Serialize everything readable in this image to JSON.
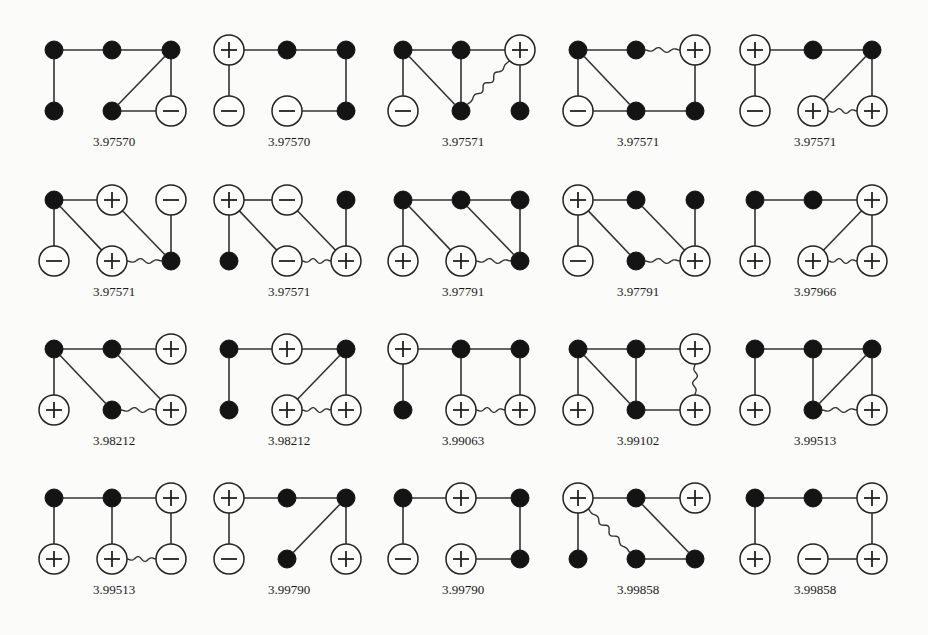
{
  "figure": {
    "node_legend": {
      "filled": "neutral site",
      "plus": "+",
      "minus": "−"
    },
    "graphs": [
      {
        "value": "3.97570",
        "nodes": {
          "t0": "filled",
          "t1": "filled",
          "t2": "filled",
          "b0": "filled",
          "b1": "filled",
          "b2": "minus"
        },
        "edges": [
          [
            "t0",
            "t1"
          ],
          [
            "t1",
            "t2"
          ],
          [
            "t0",
            "b0"
          ],
          [
            "t2",
            "b1"
          ],
          [
            "t2",
            "b2"
          ],
          [
            "b1",
            "b2"
          ]
        ],
        "wavy": []
      },
      {
        "value": "3.97570",
        "nodes": {
          "t0": "plus",
          "t1": "filled",
          "t2": "filled",
          "b0": "minus",
          "b1": "minus",
          "b2": "filled"
        },
        "edges": [
          [
            "t0",
            "t1"
          ],
          [
            "t1",
            "t2"
          ],
          [
            "t0",
            "b0"
          ],
          [
            "t2",
            "b2"
          ],
          [
            "b1",
            "b2"
          ]
        ],
        "wavy": []
      },
      {
        "value": "3.97571",
        "nodes": {
          "t0": "filled",
          "t1": "filled",
          "t2": "plus",
          "b0": "minus",
          "b1": "filled",
          "b2": "filled"
        },
        "edges": [
          [
            "t0",
            "t1"
          ],
          [
            "t1",
            "t2"
          ],
          [
            "t0",
            "b0"
          ],
          [
            "t0",
            "b1"
          ],
          [
            "t1",
            "b1"
          ],
          [
            "t2",
            "b2"
          ]
        ],
        "wavy": [
          [
            "t2",
            "b1"
          ]
        ]
      },
      {
        "value": "3.97571",
        "nodes": {
          "t0": "filled",
          "t1": "filled",
          "t2": "plus",
          "b0": "minus",
          "b1": "filled",
          "b2": "filled"
        },
        "edges": [
          [
            "t0",
            "t1"
          ],
          [
            "t0",
            "b0"
          ],
          [
            "t0",
            "b1"
          ],
          [
            "b0",
            "b1"
          ],
          [
            "b1",
            "b2"
          ],
          [
            "t2",
            "b2"
          ]
        ],
        "wavy": [
          [
            "t1",
            "t2"
          ]
        ]
      },
      {
        "value": "3.97571",
        "nodes": {
          "t0": "plus",
          "t1": "filled",
          "t2": "filled",
          "b0": "minus",
          "b1": "plus",
          "b2": "plus"
        },
        "edges": [
          [
            "t0",
            "t1"
          ],
          [
            "t1",
            "t2"
          ],
          [
            "t0",
            "b0"
          ],
          [
            "t2",
            "b1"
          ],
          [
            "t2",
            "b2"
          ]
        ],
        "wavy": [
          [
            "b1",
            "b2"
          ]
        ]
      },
      {
        "value": "3.97571",
        "nodes": {
          "t0": "filled",
          "t1": "plus",
          "t2": "minus",
          "b0": "minus",
          "b1": "plus",
          "b2": "filled"
        },
        "edges": [
          [
            "t0",
            "t1"
          ],
          [
            "t0",
            "b0"
          ],
          [
            "t0",
            "b1"
          ],
          [
            "t1",
            "b2"
          ],
          [
            "t2",
            "b2"
          ]
        ],
        "wavy": [
          [
            "b1",
            "b2"
          ]
        ]
      },
      {
        "value": "3.97571",
        "nodes": {
          "t0": "plus",
          "t1": "minus",
          "t2": "filled",
          "b0": "filled",
          "b1": "minus",
          "b2": "plus"
        },
        "edges": [
          [
            "t0",
            "t1"
          ],
          [
            "t0",
            "b0"
          ],
          [
            "t0",
            "b1"
          ],
          [
            "t1",
            "b2"
          ],
          [
            "t2",
            "b2"
          ]
        ],
        "wavy": [
          [
            "b1",
            "b2"
          ]
        ]
      },
      {
        "value": "3.97791",
        "nodes": {
          "t0": "filled",
          "t1": "filled",
          "t2": "filled",
          "b0": "plus",
          "b1": "plus",
          "b2": "filled"
        },
        "edges": [
          [
            "t0",
            "t1"
          ],
          [
            "t1",
            "t2"
          ],
          [
            "t0",
            "b0"
          ],
          [
            "t0",
            "b1"
          ],
          [
            "t1",
            "b2"
          ],
          [
            "t2",
            "b2"
          ]
        ],
        "wavy": [
          [
            "b1",
            "b2"
          ]
        ]
      },
      {
        "value": "3.97791",
        "nodes": {
          "t0": "plus",
          "t1": "filled",
          "t2": "filled",
          "b0": "minus",
          "b1": "filled",
          "b2": "plus"
        },
        "edges": [
          [
            "t0",
            "t1"
          ],
          [
            "t0",
            "b0"
          ],
          [
            "t0",
            "b1"
          ],
          [
            "t1",
            "b2"
          ],
          [
            "t2",
            "b2"
          ]
        ],
        "wavy": [
          [
            "b1",
            "b2"
          ]
        ]
      },
      {
        "value": "3.97966",
        "nodes": {
          "t0": "filled",
          "t1": "filled",
          "t2": "plus",
          "b0": "plus",
          "b1": "plus",
          "b2": "plus"
        },
        "edges": [
          [
            "t0",
            "t1"
          ],
          [
            "t1",
            "t2"
          ],
          [
            "t0",
            "b0"
          ],
          [
            "t2",
            "b1"
          ],
          [
            "t2",
            "b2"
          ]
        ],
        "wavy": [
          [
            "b1",
            "b2"
          ]
        ]
      },
      {
        "value": "3.98212",
        "nodes": {
          "t0": "filled",
          "t1": "filled",
          "t2": "plus",
          "b0": "plus",
          "b1": "filled",
          "b2": "plus"
        },
        "edges": [
          [
            "t0",
            "t1"
          ],
          [
            "t1",
            "t2"
          ],
          [
            "t0",
            "b0"
          ],
          [
            "t0",
            "b1"
          ],
          [
            "t1",
            "b2"
          ]
        ],
        "wavy": [
          [
            "b1",
            "b2"
          ]
        ]
      },
      {
        "value": "3.98212",
        "nodes": {
          "t0": "filled",
          "t1": "plus",
          "t2": "filled",
          "b0": "filled",
          "b1": "plus",
          "b2": "plus"
        },
        "edges": [
          [
            "t0",
            "t1"
          ],
          [
            "t1",
            "t2"
          ],
          [
            "t0",
            "b0"
          ],
          [
            "t2",
            "b1"
          ],
          [
            "t2",
            "b2"
          ]
        ],
        "wavy": [
          [
            "b1",
            "b2"
          ]
        ]
      },
      {
        "value": "3.99063",
        "nodes": {
          "t0": "plus",
          "t1": "filled",
          "t2": "filled",
          "b0": "filled",
          "b1": "plus",
          "b2": "plus"
        },
        "edges": [
          [
            "t0",
            "t1"
          ],
          [
            "t1",
            "t2"
          ],
          [
            "t0",
            "b0"
          ],
          [
            "t1",
            "b1"
          ],
          [
            "t2",
            "b2"
          ]
        ],
        "wavy": [
          [
            "b1",
            "b2"
          ]
        ]
      },
      {
        "value": "3.99102",
        "nodes": {
          "t0": "filled",
          "t1": "filled",
          "t2": "plus",
          "b0": "plus",
          "b1": "filled",
          "b2": "plus"
        },
        "edges": [
          [
            "t0",
            "t1"
          ],
          [
            "t1",
            "t2"
          ],
          [
            "t0",
            "b0"
          ],
          [
            "t0",
            "b1"
          ],
          [
            "t1",
            "b1"
          ],
          [
            "b1",
            "b2"
          ]
        ],
        "wavy": [
          [
            "t2",
            "b2"
          ]
        ]
      },
      {
        "value": "3.99513",
        "nodes": {
          "t0": "filled",
          "t1": "filled",
          "t2": "filled",
          "b0": "plus",
          "b1": "filled",
          "b2": "plus"
        },
        "edges": [
          [
            "t0",
            "t1"
          ],
          [
            "t1",
            "t2"
          ],
          [
            "t0",
            "b0"
          ],
          [
            "t1",
            "b1"
          ],
          [
            "t2",
            "b1"
          ],
          [
            "t2",
            "b2"
          ]
        ],
        "wavy": [
          [
            "b1",
            "b2"
          ]
        ]
      },
      {
        "value": "3.99513",
        "nodes": {
          "t0": "filled",
          "t1": "filled",
          "t2": "plus",
          "b0": "plus",
          "b1": "plus",
          "b2": "minus"
        },
        "edges": [
          [
            "t0",
            "t1"
          ],
          [
            "t1",
            "t2"
          ],
          [
            "t0",
            "b0"
          ],
          [
            "t1",
            "b1"
          ],
          [
            "t2",
            "b2"
          ]
        ],
        "wavy": [
          [
            "b1",
            "b2"
          ]
        ]
      },
      {
        "value": "3.99790",
        "nodes": {
          "t0": "plus",
          "t1": "filled",
          "t2": "filled",
          "b0": "minus",
          "b1": "filled",
          "b2": "plus"
        },
        "edges": [
          [
            "t0",
            "t1"
          ],
          [
            "t1",
            "t2"
          ],
          [
            "t0",
            "b0"
          ],
          [
            "t2",
            "b1"
          ],
          [
            "t2",
            "b2"
          ]
        ],
        "wavy": []
      },
      {
        "value": "3.99790",
        "nodes": {
          "t0": "filled",
          "t1": "plus",
          "t2": "filled",
          "b0": "minus",
          "b1": "plus",
          "b2": "filled"
        },
        "edges": [
          [
            "t0",
            "t1"
          ],
          [
            "t1",
            "t2"
          ],
          [
            "t0",
            "b0"
          ],
          [
            "t2",
            "b2"
          ],
          [
            "b1",
            "b2"
          ]
        ],
        "wavy": []
      },
      {
        "value": "3.99858",
        "nodes": {
          "t0": "plus",
          "t1": "filled",
          "t2": "plus",
          "b0": "filled",
          "b1": "filled",
          "b2": "filled"
        },
        "edges": [
          [
            "t0",
            "t1"
          ],
          [
            "t1",
            "t2"
          ],
          [
            "t0",
            "b0"
          ],
          [
            "t1",
            "b2"
          ],
          [
            "b1",
            "b2"
          ]
        ],
        "wavy": [
          [
            "t0",
            "b1"
          ]
        ]
      },
      {
        "value": "3.99858",
        "nodes": {
          "t0": "filled",
          "t1": "filled",
          "t2": "plus",
          "b0": "plus",
          "b1": "minus",
          "b2": "plus"
        },
        "edges": [
          [
            "t0",
            "t1"
          ],
          [
            "t1",
            "t2"
          ],
          [
            "t0",
            "b0"
          ],
          [
            "t2",
            "b2"
          ],
          [
            "b1",
            "b2"
          ]
        ],
        "wavy": []
      }
    ]
  }
}
